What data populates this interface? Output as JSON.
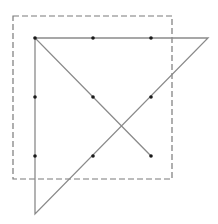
{
  "diagram": {
    "colors": {
      "background": "#ffffff",
      "line": "#8a8a8a",
      "dash_box": "#7a7a7a",
      "dot": "#1a1a1a"
    },
    "dashed_box": {
      "x": 13,
      "y": 16,
      "width": 159,
      "height": 163
    },
    "dots": [
      {
        "x": 35,
        "y": 38
      },
      {
        "x": 93,
        "y": 38
      },
      {
        "x": 151,
        "y": 38
      },
      {
        "x": 35,
        "y": 97
      },
      {
        "x": 93,
        "y": 97
      },
      {
        "x": 151,
        "y": 97
      },
      {
        "x": 35,
        "y": 156
      },
      {
        "x": 93,
        "y": 156
      },
      {
        "x": 151,
        "y": 156
      }
    ],
    "path": [
      {
        "x": 151,
        "y": 156
      },
      {
        "x": 35,
        "y": 38
      },
      {
        "x": 208,
        "y": 38
      },
      {
        "x": 35,
        "y": 214
      },
      {
        "x": 35,
        "y": 38
      }
    ]
  }
}
